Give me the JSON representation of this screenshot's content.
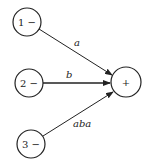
{
  "diagram": {
    "type": "signal-flow-graph",
    "nodes": [
      {
        "id": "n1",
        "label": "1 −",
        "cx": 27,
        "cy": 22,
        "r": 14
      },
      {
        "id": "n2",
        "label": "2 −",
        "cx": 29,
        "cy": 83,
        "r": 14
      },
      {
        "id": "n3",
        "label": "3 −",
        "cx": 31,
        "cy": 144,
        "r": 14
      },
      {
        "id": "sum",
        "label": "+",
        "cx": 126,
        "cy": 82,
        "r": 15
      }
    ],
    "edges": [
      {
        "from": "n1",
        "to": "sum",
        "label": "a"
      },
      {
        "from": "n2",
        "to": "sum",
        "label": "b"
      },
      {
        "from": "n3",
        "to": "sum",
        "label": "aba"
      }
    ],
    "colors": {
      "stroke": "#222222",
      "background": "#ffffff"
    }
  }
}
